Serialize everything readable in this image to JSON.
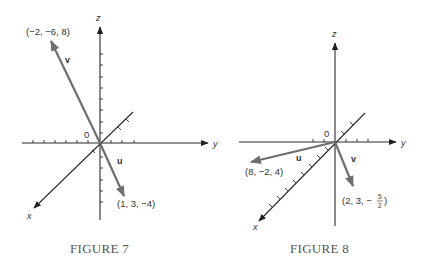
{
  "figures": [
    {
      "caption": "FIGURE 7",
      "axes": {
        "x": "x",
        "y": "y",
        "z": "z",
        "origin": "0"
      },
      "vectors": [
        {
          "name": "v",
          "endpoint_label": "(−2, −6, 8)",
          "components": [
            -2,
            -6,
            8
          ]
        },
        {
          "name": "u",
          "endpoint_label": "(1, 3, −4)",
          "components": [
            1,
            3,
            -4
          ]
        }
      ]
    },
    {
      "caption": "FIGURE 8",
      "axes": {
        "x": "x",
        "y": "y",
        "z": "z",
        "origin": "0"
      },
      "vectors": [
        {
          "name": "u",
          "endpoint_label": "(8, −2, 4)",
          "components": [
            8,
            -2,
            4
          ]
        },
        {
          "name": "v",
          "endpoint_label_prefix": "(2, 3, −",
          "endpoint_label_frac_num": "5",
          "endpoint_label_frac_den": "2",
          "endpoint_label_suffix": ")",
          "components": [
            2,
            3,
            -2.5
          ]
        }
      ]
    }
  ]
}
